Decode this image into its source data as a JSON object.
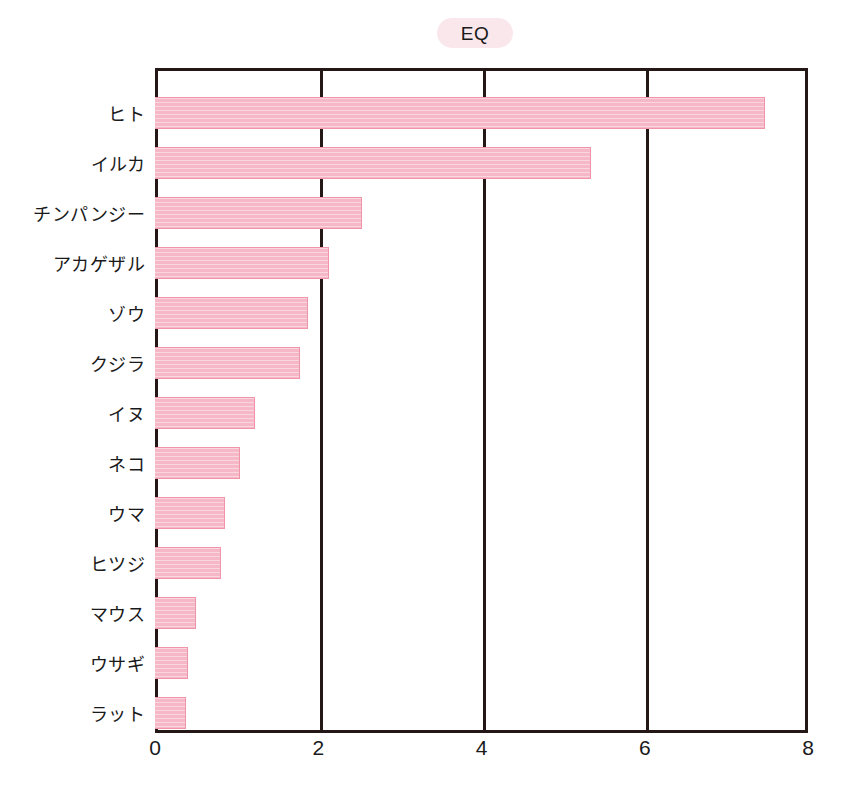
{
  "chart": {
    "title": "EQ",
    "title_pill_color": "#fae7ec",
    "bar_fill_color": "#f6b8c7",
    "bar_border_color": "#f193a9",
    "axis_color": "#231815",
    "background_color": "#ffffff"
  },
  "chart_data": {
    "type": "bar",
    "orientation": "horizontal",
    "title": "EQ",
    "xlabel": "",
    "ylabel": "",
    "xlim": [
      0,
      8
    ],
    "grid": true,
    "grid_axis": "x",
    "legend": "none",
    "xticks": [
      "0",
      "2",
      "4",
      "6",
      "8"
    ],
    "xtick_values": [
      0,
      2,
      4,
      6,
      8
    ],
    "categories": [
      "ヒト",
      "イルカ",
      "チンパンジー",
      "アカゲザル",
      "ゾウ",
      "クジラ",
      "イヌ",
      "ネコ",
      "ウマ",
      "ヒツジ",
      "マウス",
      "ウサギ",
      "ラット"
    ],
    "values": [
      7.47,
      5.34,
      2.54,
      2.13,
      1.87,
      1.78,
      1.22,
      1.04,
      0.86,
      0.81,
      0.5,
      0.4,
      0.38
    ]
  }
}
